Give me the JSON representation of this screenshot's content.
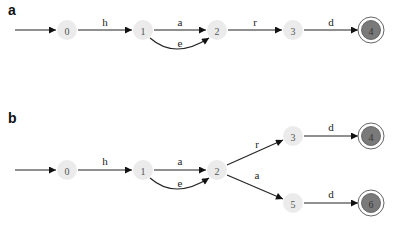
{
  "panels": [
    {
      "label": "a",
      "nodes": [
        {
          "id": "0",
          "label": "0",
          "x": 67,
          "y": 30,
          "final": false
        },
        {
          "id": "1",
          "label": "1",
          "x": 143,
          "y": 30,
          "final": false
        },
        {
          "id": "2",
          "label": "2",
          "x": 217,
          "y": 30,
          "final": false
        },
        {
          "id": "3",
          "label": "3",
          "x": 293,
          "y": 30,
          "final": false
        },
        {
          "id": "4",
          "label": "4",
          "x": 371,
          "y": 30,
          "final": true
        }
      ],
      "edges": [
        {
          "from": "start",
          "to": "0",
          "label": ""
        },
        {
          "from": "0",
          "to": "1",
          "label": "h"
        },
        {
          "from": "1",
          "to": "2",
          "label": "a"
        },
        {
          "from": "1",
          "to": "2",
          "label": "e",
          "curved": true
        },
        {
          "from": "2",
          "to": "3",
          "label": "r"
        },
        {
          "from": "3",
          "to": "4",
          "label": "d"
        }
      ]
    },
    {
      "label": "b",
      "nodes": [
        {
          "id": "0",
          "label": "0",
          "x": 67,
          "y": 170,
          "final": false
        },
        {
          "id": "1",
          "label": "1",
          "x": 143,
          "y": 170,
          "final": false
        },
        {
          "id": "2",
          "label": "2",
          "x": 217,
          "y": 170,
          "final": false
        },
        {
          "id": "3",
          "label": "3",
          "x": 293,
          "y": 136,
          "final": false
        },
        {
          "id": "4",
          "label": "4",
          "x": 371,
          "y": 136,
          "final": true
        },
        {
          "id": "5",
          "label": "5",
          "x": 293,
          "y": 203,
          "final": false
        },
        {
          "id": "6",
          "label": "6",
          "x": 371,
          "y": 203,
          "final": true
        }
      ],
      "edges": [
        {
          "from": "start",
          "to": "0",
          "label": ""
        },
        {
          "from": "0",
          "to": "1",
          "label": "h"
        },
        {
          "from": "1",
          "to": "2",
          "label": "a"
        },
        {
          "from": "1",
          "to": "2",
          "label": "e",
          "curved": true
        },
        {
          "from": "2",
          "to": "3",
          "label": "r"
        },
        {
          "from": "2",
          "to": "5",
          "label": "a"
        },
        {
          "from": "3",
          "to": "4",
          "label": "d"
        },
        {
          "from": "5",
          "to": "6",
          "label": "d"
        }
      ]
    }
  ]
}
